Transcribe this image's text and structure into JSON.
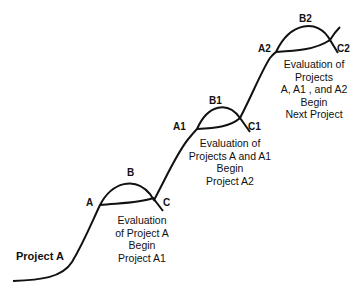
{
  "title": "Project A",
  "stages": [
    {
      "start_label": "A",
      "peak_label": "B",
      "end_label": "C",
      "note": [
        "Evaluation",
        "of Project A",
        "Begin",
        "Project A1"
      ]
    },
    {
      "start_label": "A1",
      "peak_label": "B1",
      "end_label": "C1",
      "note": [
        "Evaluation of",
        "Projects A and A1",
        "Begin",
        "Project A2"
      ]
    },
    {
      "start_label": "A2",
      "peak_label": "B2",
      "end_label": "C2",
      "note": [
        "Evaluation of",
        "Projects",
        "A, A1 , and A2",
        "Begin",
        "Next Project"
      ]
    }
  ],
  "colors": {
    "line": "#111111",
    "text": "#111111",
    "background": "#ffffff"
  }
}
